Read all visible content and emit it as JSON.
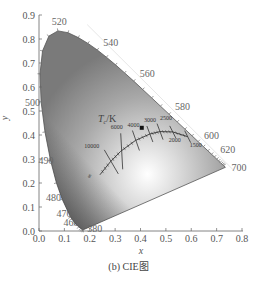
{
  "chart_data": {
    "type": "scatter",
    "caption": "(b) CIE图",
    "xlabel": "x",
    "ylabel": "y",
    "xlim": [
      0.0,
      0.8
    ],
    "ylim": [
      0.0,
      0.9
    ],
    "xticks": [
      "0.0",
      "0.1",
      "0.2",
      "0.3",
      "0.4",
      "0.5",
      "0.6",
      "0.7",
      "0.8"
    ],
    "yticks": [
      "0.0",
      "0.1",
      "0.2",
      "0.3",
      "0.4",
      "0.5",
      "0.6",
      "0.7",
      "0.8",
      "0.9"
    ],
    "grid": false,
    "spectral_locus_labels": [
      {
        "nm": "460",
        "x": 0.144,
        "y": 0.03
      },
      {
        "nm": "470",
        "x": 0.124,
        "y": 0.058
      },
      {
        "nm": "480",
        "x": 0.091,
        "y": 0.133
      },
      {
        "nm": "490",
        "x": 0.045,
        "y": 0.295
      },
      {
        "nm": "500",
        "x": 0.008,
        "y": 0.538
      },
      {
        "nm": "520",
        "x": 0.074,
        "y": 0.834
      },
      {
        "nm": "540",
        "x": 0.23,
        "y": 0.754
      },
      {
        "nm": "560",
        "x": 0.373,
        "y": 0.624
      },
      {
        "nm": "580",
        "x": 0.512,
        "y": 0.487
      },
      {
        "nm": "600",
        "x": 0.627,
        "y": 0.373
      },
      {
        "nm": "620",
        "x": 0.691,
        "y": 0.308
      },
      {
        "nm": "700",
        "x": 0.735,
        "y": 0.265
      },
      {
        "nm": "380",
        "x": 0.174,
        "y": 0.005
      }
    ],
    "planckian_locus": {
      "label": "Tc/K",
      "points": [
        {
          "T": "∞",
          "x": 0.24,
          "y": 0.234
        },
        {
          "T": "10000",
          "x": 0.281,
          "y": 0.288
        },
        {
          "T": "6000",
          "x": 0.322,
          "y": 0.332
        },
        {
          "T": "4000",
          "x": 0.38,
          "y": 0.377
        },
        {
          "T": "3000",
          "x": 0.437,
          "y": 0.404
        },
        {
          "T": "2500",
          "x": 0.477,
          "y": 0.414
        },
        {
          "T": "2000",
          "x": 0.527,
          "y": 0.413
        },
        {
          "T": "1500",
          "x": 0.586,
          "y": 0.393
        }
      ]
    },
    "marked_point": {
      "x": 0.405,
      "y": 0.43
    }
  },
  "labels": {
    "tc_symbol": "T",
    "tc_sub": "c",
    "tc_unit": "/K"
  }
}
